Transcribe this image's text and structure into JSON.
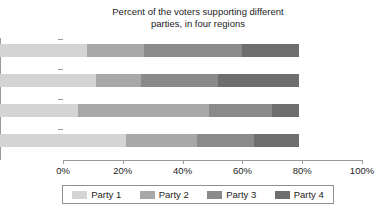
{
  "chart_data": {
    "type": "bar",
    "orientation": "horizontal",
    "stacked": true,
    "normalized": "100%",
    "title": "Percent of the voters supporting different\nparties, in four regions",
    "xlabel": "",
    "ylabel": "",
    "xlim": [
      0,
      100
    ],
    "xticks": [
      0,
      20,
      40,
      60,
      80,
      100
    ],
    "xticklabels": [
      "0%",
      "20%",
      "40%",
      "60%",
      "80%",
      "100%"
    ],
    "grid": false,
    "legend_position": "bottom",
    "categories": [
      "Region 1",
      "Region 2",
      "Region 3",
      "Region 4"
    ],
    "category_order_top_to_bottom": [
      "Region 4",
      "Region 3",
      "Region 2",
      "Region 1"
    ],
    "series": [
      {
        "name": "Party 1",
        "color": "#d4d4d4",
        "values": [
          42,
          26,
          32,
          29
        ]
      },
      {
        "name": "Party 2",
        "color": "#a8a8a8",
        "values": [
          24,
          44,
          15,
          19
        ]
      },
      {
        "name": "Party 3",
        "color": "#8a8a8a",
        "values": [
          19,
          21,
          26,
          33
        ]
      },
      {
        "name": "Party 4",
        "color": "#6e6e6e",
        "values": [
          15,
          9,
          27,
          19
        ]
      }
    ],
    "cumulative_boundaries": {
      "Region 1": [
        42,
        66,
        85,
        100
      ],
      "Region 2": [
        26,
        70,
        91,
        100
      ],
      "Region 3": [
        32,
        47,
        73,
        100
      ],
      "Region 4": [
        29,
        48,
        81,
        100
      ]
    }
  },
  "legend": {
    "items": [
      {
        "label": "Party 1",
        "color": "#d4d4d4"
      },
      {
        "label": "Party 2",
        "color": "#a8a8a8"
      },
      {
        "label": "Party 3",
        "color": "#8a8a8a"
      },
      {
        "label": "Party 4",
        "color": "#6e6e6e"
      }
    ]
  },
  "axis": {
    "x_tick_labels": [
      "0%",
      "20%",
      "40%",
      "60%",
      "80%",
      "100%"
    ],
    "y_tick_labels_top_to_bottom": [
      "Region 4",
      "Region 3",
      "Region 2",
      "Region 1"
    ]
  }
}
